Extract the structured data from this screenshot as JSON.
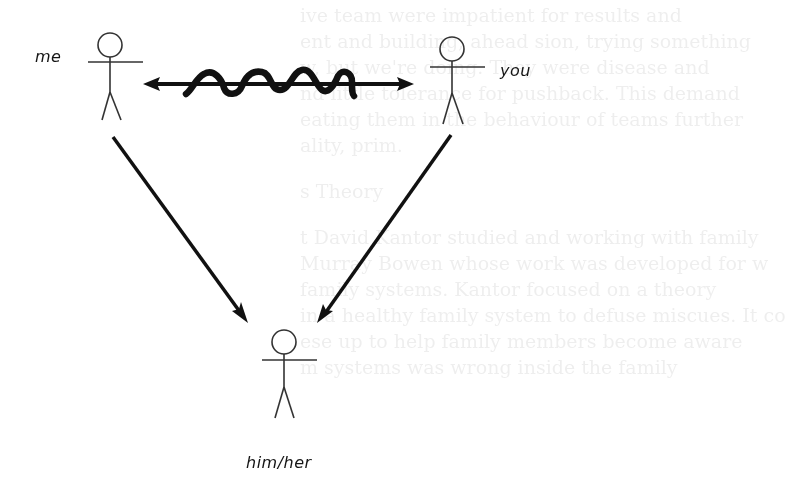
{
  "diagram": {
    "type": "relationship-triangle",
    "nodes": {
      "me": {
        "label": "me"
      },
      "you": {
        "label": "you"
      },
      "third": {
        "label": "him/her"
      }
    },
    "edges": [
      {
        "from": "me",
        "to": "you",
        "style": "double-arrow with wavy line (conflict)"
      },
      {
        "from": "me",
        "to": "third",
        "style": "arrow"
      },
      {
        "from": "you",
        "to": "third",
        "style": "arrow"
      }
    ],
    "colors": {
      "stroke": "#111111",
      "background": "#ffffff"
    }
  },
  "background_bleed_through": {
    "lines": [
      "ive team were impatient for results and",
      "ent and building, ahead sion, trying something",
      "w, but we're doing. They were disease and",
      "nd little tolerance for pushback. This demand",
      "eating them in the behaviour of teams further",
      "ality, prim.",
      "s Theory",
      "t David Kantor studied and working with family",
      "Murray Bowen whose work was developed for w",
      "family systems. Kantor focused on a theory",
      "in a healthy family system to defuse miscues. It co",
      "ese up to help family members become aware",
      "m systems was wrong inside the family"
    ]
  }
}
